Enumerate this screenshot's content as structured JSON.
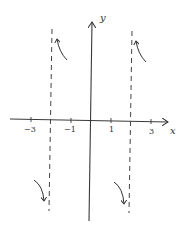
{
  "figure": {
    "type": "function-sketch",
    "colors": {
      "axis": "#3a3a3a",
      "asymptote": "#444444",
      "curve": "#333333",
      "background": "#ffffff"
    },
    "axes": {
      "x_label": "x",
      "y_label": "y",
      "x_ticks": [
        {
          "value": -3,
          "label": "−3"
        },
        {
          "value": -2,
          "label": ""
        },
        {
          "value": -1,
          "label": "−1"
        },
        {
          "value": 1,
          "label": "1"
        },
        {
          "value": 2,
          "label": ""
        },
        {
          "value": 3,
          "label": "3"
        }
      ]
    },
    "asymptotes": [
      {
        "x": -2,
        "style": "dashed"
      },
      {
        "x": 2,
        "style": "dashed"
      }
    ],
    "curve_fragments": [
      {
        "name": "upper-left",
        "near_asymptote": -2,
        "side": "right",
        "direction": "up"
      },
      {
        "name": "upper-right",
        "near_asymptote": 2,
        "side": "right",
        "direction": "up"
      },
      {
        "name": "lower-left",
        "near_asymptote": -2,
        "side": "left",
        "direction": "down"
      },
      {
        "name": "lower-right",
        "near_asymptote": 2,
        "side": "left",
        "direction": "down"
      }
    ]
  }
}
